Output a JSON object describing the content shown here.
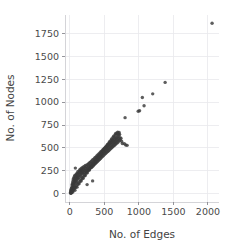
{
  "chart_data": {
    "type": "scatter",
    "title": "",
    "xlabel": "No. of Edges",
    "ylabel": "No. of Nodes",
    "xlim": [
      -70,
      2160
    ],
    "ylim": [
      -90,
      1950
    ],
    "xticks": [
      0,
      500,
      1000,
      1500,
      2000
    ],
    "ytick_labels": [
      "0",
      "250",
      "500",
      "750",
      "1000",
      "1250",
      "1500",
      "1750"
    ],
    "xtick_labels": [
      "0",
      "500",
      "1000",
      "1500",
      "2000"
    ],
    "yticks": [
      0,
      250,
      500,
      750,
      1000,
      1250,
      1500,
      1750
    ],
    "grid": true,
    "legend": "none",
    "marker_color": "#3b3b3b",
    "marker_opacity": 0.82,
    "marker_size": 3.4,
    "background": "#ffffff",
    "gridline_color": "#e8e8ec",
    "points": [
      [
        8,
        10
      ],
      [
        12,
        22
      ],
      [
        15,
        35
      ],
      [
        18,
        8
      ],
      [
        20,
        48
      ],
      [
        22,
        30
      ],
      [
        25,
        60
      ],
      [
        28,
        18
      ],
      [
        30,
        72
      ],
      [
        32,
        95
      ],
      [
        35,
        55
      ],
      [
        38,
        110
      ],
      [
        40,
        40
      ],
      [
        42,
        128
      ],
      [
        45,
        85
      ],
      [
        48,
        150
      ],
      [
        50,
        65
      ],
      [
        52,
        105
      ],
      [
        55,
        170
      ],
      [
        58,
        120
      ],
      [
        60,
        92
      ],
      [
        62,
        145
      ],
      [
        65,
        185
      ],
      [
        68,
        75
      ],
      [
        70,
        160
      ],
      [
        72,
        200
      ],
      [
        75,
        130
      ],
      [
        78,
        112
      ],
      [
        80,
        280
      ],
      [
        82,
        175
      ],
      [
        85,
        148
      ],
      [
        88,
        205
      ],
      [
        90,
        125
      ],
      [
        92,
        190
      ],
      [
        95,
        165
      ],
      [
        98,
        220
      ],
      [
        100,
        140
      ],
      [
        105,
        182
      ],
      [
        110,
        215
      ],
      [
        112,
        160
      ],
      [
        115,
        240
      ],
      [
        118,
        195
      ],
      [
        120,
        170
      ],
      [
        125,
        228
      ],
      [
        130,
        205
      ],
      [
        135,
        250
      ],
      [
        138,
        180
      ],
      [
        142,
        232
      ],
      [
        145,
        262
      ],
      [
        150,
        210
      ],
      [
        155,
        245
      ],
      [
        158,
        195
      ],
      [
        162,
        272
      ],
      [
        165,
        230
      ],
      [
        170,
        258
      ],
      [
        175,
        215
      ],
      [
        178,
        285
      ],
      [
        182,
        248
      ],
      [
        185,
        225
      ],
      [
        190,
        270
      ],
      [
        195,
        240
      ],
      [
        200,
        295
      ],
      [
        205,
        262
      ],
      [
        210,
        230
      ],
      [
        215,
        288
      ],
      [
        220,
        255
      ],
      [
        225,
        310
      ],
      [
        230,
        275
      ],
      [
        235,
        245
      ],
      [
        240,
        300
      ],
      [
        245,
        268
      ],
      [
        250,
        100
      ],
      [
        252,
        318
      ],
      [
        258,
        285
      ],
      [
        262,
        255
      ],
      [
        268,
        325
      ],
      [
        272,
        295
      ],
      [
        278,
        268
      ],
      [
        282,
        335
      ],
      [
        288,
        305
      ],
      [
        292,
        275
      ],
      [
        298,
        345
      ],
      [
        302,
        315
      ],
      [
        308,
        288
      ],
      [
        312,
        355
      ],
      [
        318,
        325
      ],
      [
        322,
        295
      ],
      [
        328,
        368
      ],
      [
        330,
        140
      ],
      [
        335,
        335
      ],
      [
        340,
        305
      ],
      [
        345,
        378
      ],
      [
        350,
        348
      ],
      [
        355,
        318
      ],
      [
        360,
        390
      ],
      [
        365,
        358
      ],
      [
        370,
        330
      ],
      [
        375,
        400
      ],
      [
        380,
        370
      ],
      [
        385,
        340
      ],
      [
        390,
        412
      ],
      [
        395,
        382
      ],
      [
        400,
        352
      ],
      [
        405,
        422
      ],
      [
        410,
        392
      ],
      [
        415,
        362
      ],
      [
        420,
        435
      ],
      [
        425,
        405
      ],
      [
        430,
        375
      ],
      [
        435,
        445
      ],
      [
        440,
        415
      ],
      [
        445,
        385
      ],
      [
        450,
        458
      ],
      [
        455,
        428
      ],
      [
        460,
        398
      ],
      [
        465,
        468
      ],
      [
        470,
        438
      ],
      [
        475,
        408
      ],
      [
        480,
        480
      ],
      [
        485,
        450
      ],
      [
        490,
        420
      ],
      [
        495,
        492
      ],
      [
        500,
        462
      ],
      [
        505,
        432
      ],
      [
        510,
        500
      ],
      [
        515,
        472
      ],
      [
        520,
        442
      ],
      [
        525,
        512
      ],
      [
        530,
        482
      ],
      [
        535,
        452
      ],
      [
        540,
        522
      ],
      [
        545,
        492
      ],
      [
        550,
        462
      ],
      [
        555,
        532
      ],
      [
        560,
        502
      ],
      [
        565,
        472
      ],
      [
        570,
        545
      ],
      [
        575,
        512
      ],
      [
        580,
        482
      ],
      [
        585,
        555
      ],
      [
        590,
        525
      ],
      [
        595,
        495
      ],
      [
        600,
        565
      ],
      [
        605,
        535
      ],
      [
        610,
        505
      ],
      [
        615,
        575
      ],
      [
        620,
        545
      ],
      [
        625,
        515
      ],
      [
        630,
        585
      ],
      [
        635,
        555
      ],
      [
        640,
        525
      ],
      [
        645,
        562
      ],
      [
        650,
        595
      ],
      [
        655,
        535
      ],
      [
        660,
        572
      ],
      [
        665,
        605
      ],
      [
        670,
        545
      ],
      [
        675,
        582
      ],
      [
        680,
        615
      ],
      [
        685,
        555
      ],
      [
        690,
        592
      ],
      [
        695,
        625
      ],
      [
        700,
        565
      ],
      [
        705,
        602
      ],
      [
        710,
        638
      ],
      [
        715,
        578
      ],
      [
        720,
        648
      ],
      [
        725,
        612
      ],
      [
        730,
        588
      ],
      [
        740,
        605
      ],
      [
        750,
        572
      ],
      [
        760,
        548
      ],
      [
        790,
        545
      ],
      [
        800,
        830
      ],
      [
        810,
        532
      ],
      [
        830,
        528
      ],
      [
        990,
        900
      ],
      [
        1010,
        905
      ],
      [
        1050,
        1050
      ],
      [
        1075,
        960
      ],
      [
        1200,
        1090
      ],
      [
        1380,
        1215
      ],
      [
        2060,
        1860
      ],
      [
        14,
        5
      ],
      [
        24,
        12
      ],
      [
        34,
        28
      ],
      [
        44,
        18
      ],
      [
        54,
        42
      ],
      [
        64,
        58
      ],
      [
        74,
        38
      ],
      [
        84,
        68
      ],
      [
        94,
        88
      ],
      [
        104,
        72
      ],
      [
        114,
        100
      ],
      [
        124,
        118
      ],
      [
        134,
        108
      ],
      [
        144,
        132
      ],
      [
        154,
        148
      ],
      [
        164,
        138
      ],
      [
        174,
        162
      ],
      [
        184,
        178
      ],
      [
        194,
        168
      ],
      [
        204,
        192
      ],
      [
        214,
        208
      ],
      [
        224,
        198
      ],
      [
        234,
        222
      ],
      [
        244,
        238
      ],
      [
        254,
        228
      ],
      [
        264,
        252
      ],
      [
        274,
        268
      ],
      [
        284,
        258
      ],
      [
        294,
        282
      ],
      [
        304,
        298
      ],
      [
        314,
        288
      ],
      [
        324,
        312
      ],
      [
        334,
        328
      ],
      [
        344,
        318
      ],
      [
        354,
        342
      ],
      [
        364,
        358
      ],
      [
        374,
        348
      ],
      [
        384,
        372
      ],
      [
        394,
        388
      ],
      [
        404,
        378
      ],
      [
        414,
        402
      ],
      [
        424,
        418
      ],
      [
        434,
        408
      ],
      [
        444,
        432
      ],
      [
        454,
        448
      ],
      [
        464,
        438
      ],
      [
        474,
        462
      ],
      [
        484,
        478
      ],
      [
        494,
        468
      ],
      [
        504,
        492
      ],
      [
        514,
        508
      ],
      [
        524,
        498
      ],
      [
        534,
        522
      ],
      [
        544,
        538
      ],
      [
        554,
        528
      ],
      [
        564,
        552
      ],
      [
        574,
        568
      ],
      [
        584,
        558
      ],
      [
        594,
        582
      ],
      [
        604,
        598
      ],
      [
        614,
        588
      ],
      [
        624,
        612
      ],
      [
        634,
        628
      ],
      [
        644,
        618
      ],
      [
        654,
        642
      ],
      [
        664,
        658
      ],
      [
        674,
        648
      ],
      [
        684,
        662
      ],
      [
        694,
        672
      ],
      [
        704,
        655
      ],
      [
        714,
        668
      ]
    ]
  }
}
